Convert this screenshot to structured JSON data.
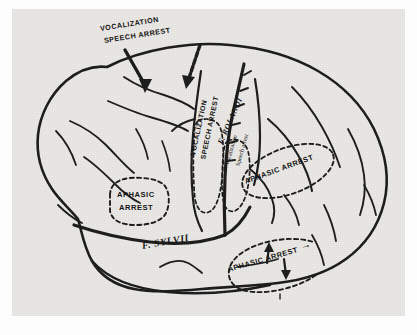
{
  "figure": {
    "plate_background": "#eceae7",
    "ink_color": "#1a1a1a"
  },
  "labels": {
    "top_callout": {
      "line1": "VOCALIZATION",
      "line2": "SPEECH ARREST",
      "name": "top-vocalization-speech-arrest-callout"
    },
    "precentral_caps": {
      "line1": "VOCALIZATION",
      "line2": "SPEECH ARREST"
    },
    "postcentral_mixed": {
      "line1": "Vocalization",
      "line2": "Speech arrest"
    },
    "sulci": {
      "rolandic": "F. ROLANDI",
      "sylvian": "F. SYLVII"
    },
    "aphasic_frontal": {
      "line1": "APHASIC",
      "line2": "ARREST"
    },
    "aphasic_parietal": "APHASIC ARREST",
    "aphasic_temporal": "APHASIC ARREST",
    "aphasic_temporal_arrow": "→"
  },
  "icons": {
    "arrow_down_left": "arrow-down-callout-left-icon",
    "arrow_down_right": "arrow-down-callout-right-icon",
    "arrow_up_temporal": "arrow-up-temporal-icon",
    "arrow_down_temporal": "arrow-down-temporal-icon",
    "arrow_right_temporal": "arrow-right-temporal-icon"
  }
}
